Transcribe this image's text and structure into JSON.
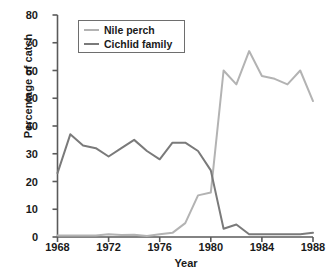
{
  "chart_data": {
    "type": "line",
    "title": "",
    "xlabel": "Year",
    "ylabel": "Percentage of catch",
    "xlim": [
      1968,
      1988
    ],
    "ylim": [
      0,
      80
    ],
    "xticks": [
      1968,
      1972,
      1976,
      1980,
      1984,
      1988
    ],
    "yticks": [
      0,
      10,
      20,
      30,
      40,
      50,
      60,
      70,
      80
    ],
    "grid": false,
    "legend_position": "upper-left",
    "x": [
      1968,
      1969,
      1970,
      1971,
      1972,
      1973,
      1974,
      1975,
      1976,
      1977,
      1978,
      1979,
      1980,
      1981,
      1982,
      1983,
      1984,
      1985,
      1986,
      1987,
      1988
    ],
    "series": [
      {
        "name": "Nile perch",
        "color": "#b3b3b3",
        "values": [
          0.5,
          0.5,
          0.5,
          0.5,
          1.0,
          0.7,
          0.8,
          0.4,
          1.0,
          1.5,
          5.0,
          15.0,
          16.0,
          60.0,
          55.0,
          67.0,
          58.0,
          57.0,
          55.0,
          60.0,
          49.0
        ]
      },
      {
        "name": "Cichlid family",
        "color": "#7a7a7a",
        "values": [
          23.0,
          37.0,
          33.0,
          32.0,
          29.0,
          32.0,
          35.0,
          31.0,
          28.0,
          34.0,
          34.0,
          31.0,
          24.0,
          3.0,
          4.5,
          1.0,
          1.0,
          1.0,
          1.0,
          1.0,
          1.5
        ]
      }
    ]
  },
  "axis": {
    "y_title": "Percentage of catch",
    "x_title": "Year",
    "y_tick_labels": [
      "80",
      "70",
      "60",
      "50",
      "40",
      "30",
      "20",
      "10",
      "0"
    ],
    "x_tick_labels": [
      "1968",
      "1972",
      "1976",
      "1980",
      "1984",
      "1988"
    ]
  },
  "legend": {
    "entries": [
      {
        "label": "Nile perch",
        "color": "#b3b3b3"
      },
      {
        "label": "Cichlid family",
        "color": "#7a7a7a"
      }
    ]
  },
  "colors": {
    "nile_perch": "#b3b3b3",
    "cichlid_family": "#7a7a7a",
    "axis": "#5a5a5a",
    "text": "#1a1a1a",
    "background": "#ffffff"
  }
}
